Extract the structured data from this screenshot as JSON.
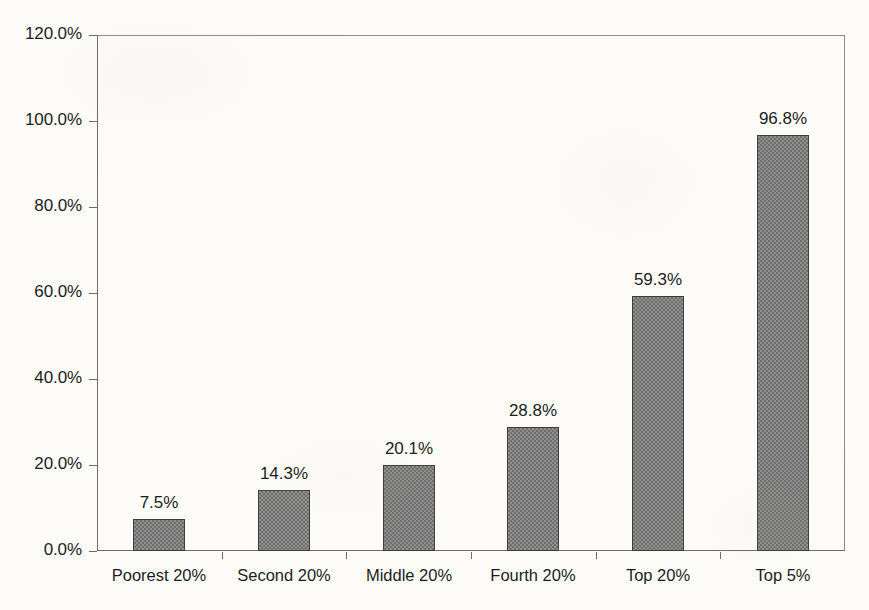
{
  "chart_data": {
    "type": "bar",
    "title": "",
    "subtitle": "",
    "xlabel": "",
    "ylabel": "",
    "categories": [
      "Poorest 20%",
      "Second 20%",
      "Middle 20%",
      "Fourth 20%",
      "Top 20%",
      "Top 5%"
    ],
    "values": [
      7.5,
      14.3,
      20.1,
      28.8,
      59.3,
      96.8
    ],
    "value_labels": [
      "7.5%",
      "14.3%",
      "20.1%",
      "28.8%",
      "59.3%",
      "96.8%"
    ],
    "ylim": [
      0,
      120
    ],
    "y_tick_values": [
      0,
      20,
      40,
      60,
      80,
      100,
      120
    ],
    "y_tick_labels": [
      "0.0%",
      "20.0%",
      "40.0%",
      "60.0%",
      "80.0%",
      "100.0%",
      "120.0%"
    ],
    "grid": false,
    "legend": null,
    "legend_position": "none",
    "series": [
      {
        "name": "",
        "values": [
          7.5,
          14.3,
          20.1,
          28.8,
          59.3,
          96.8
        ]
      }
    ],
    "colors": {
      "bar_fill": "#7d7d7d",
      "bar_border": "#3d3d3d",
      "axis": "#6d6d68",
      "text": "#1c1c1c",
      "background": "#fdfcf8"
    }
  }
}
